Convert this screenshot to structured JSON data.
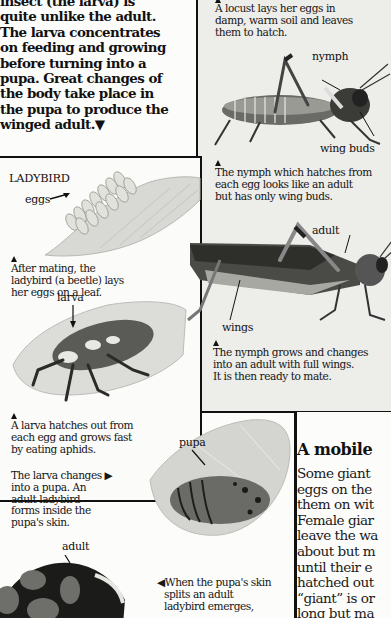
{
  "intro": {
    "lines": [
      "insect (the larva) is",
      "quite unlike the adult.",
      "The larva concentrates",
      "on feeding and growing",
      "before turning into a",
      "pupa. Great changes of",
      "the body take place in",
      "the pupa to produce the",
      "winged adult.▼"
    ]
  },
  "locust": {
    "caption_eggs": [
      "A locust lays her eggs in",
      "damp, warm soil and leaves",
      "them to hatch."
    ],
    "labels": {
      "nymph": "nymph",
      "wing_buds": "wing buds",
      "adult": "adult",
      "wings": "wings"
    },
    "caption_nymph": [
      "The nymph which hatches from",
      "each egg looks like an adult",
      "but has only wing buds."
    ],
    "caption_adult": [
      "The nymph grows and changes",
      "into an adult with full wings.",
      "It is then ready to mate."
    ]
  },
  "ladybird": {
    "title": "LADYBIRD",
    "labels": {
      "eggs": "eggs",
      "larva": "larva",
      "pupa": "pupa",
      "adult": "adult"
    },
    "caption_eggs": [
      "After mating, the",
      "ladybird (a beetle) lays",
      "her eggs on a leaf."
    ],
    "caption_larva": [
      "A larva hatches out from",
      "each egg and grows fast",
      "by eating aphids."
    ],
    "caption_pupa": [
      "The larva changes ▶",
      "into a pupa. An",
      "adult ladybird",
      "forms inside the",
      "pupa's skin."
    ],
    "caption_adult": [
      "◀When the pupa's skin",
      "splits an adult",
      "ladybird emerges,"
    ]
  },
  "mobile": {
    "title": "A mobile",
    "lines": [
      "Some giant",
      "eggs on the",
      "them on wit",
      "Female giar",
      "leave the wa",
      "about but m",
      "until their e",
      "hatched out",
      "“giant” is or",
      "long but ma",
      "l"
    ]
  }
}
